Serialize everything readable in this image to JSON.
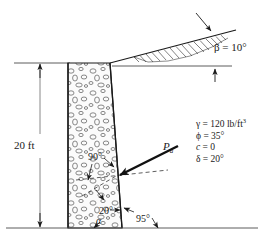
{
  "figure": {
    "background_color": "#ffffff",
    "line_color": "#1a1a1a"
  },
  "dimensions": {
    "wall_height": "20 ft"
  },
  "angles": {
    "backfill_slope": "β = 10°",
    "wall_face_normal": "90°",
    "force_inclination": "20°",
    "base_angle_symbol": "α",
    "back_face_angle": "95°"
  },
  "force": {
    "label": "P",
    "subscript": "a"
  },
  "soil_properties": {
    "unit_weight_symbol": "γ",
    "unit_weight": " = 120 lb/ft",
    "unit_weight_exponent": "3",
    "friction_angle": "ϕ = 35°",
    "cohesion_symbol": "c",
    "cohesion_value": " = 0",
    "wall_friction": "δ = 20°"
  },
  "elements": {
    "ground_line": "ground-surface-line",
    "base_line": "foundation-base-line",
    "wall_body": "stone-masonry-wall",
    "hatch_wedge": "backfill-slope-hatching",
    "dimension_line": "height-dimension-line",
    "force_arrow": "active-earth-pressure-arrow",
    "normal_dashed": "normal-to-wall-dashed-line"
  }
}
